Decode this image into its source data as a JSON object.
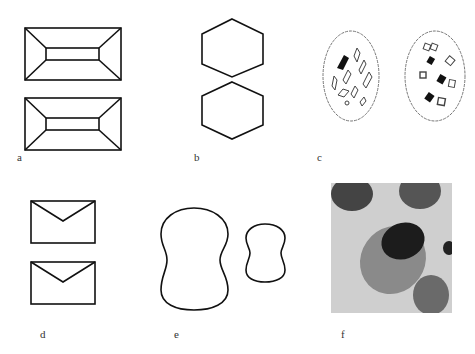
{
  "figure": {
    "panels": [
      {
        "id": "a",
        "label": "a",
        "description": "two rectangles with inner rectangle (truncated pyramid, top view)"
      },
      {
        "id": "b",
        "label": "b",
        "description": "two stacked hexagons"
      },
      {
        "id": "c",
        "label": "c",
        "description": "two circular fields containing rhombic crystals"
      },
      {
        "id": "d",
        "label": "d",
        "description": "two envelope-shaped outlines"
      },
      {
        "id": "e",
        "label": "e",
        "description": "two peanut/dumbbell-shaped outlines"
      },
      {
        "id": "f",
        "label": "f",
        "description": "grayscale micrograph of cell"
      }
    ],
    "colors": {
      "stroke": "#111111",
      "background": "#ffffff",
      "micrograph_bg": "#cfcfcf"
    }
  }
}
